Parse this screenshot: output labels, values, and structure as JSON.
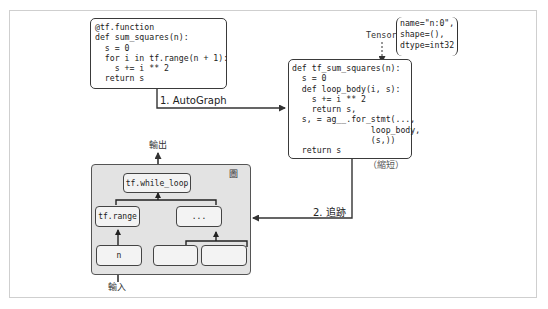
{
  "diagram": {
    "source_code": {
      "lines": [
        "@tf.function",
        "def sum_squares(n):",
        "  s = 0",
        "  for i in tf.range(n + 1):",
        "    s += i ** 2",
        "  return s"
      ]
    },
    "converted_code": {
      "lines": [
        "def tf_sum_squares(n):",
        "  s = 0",
        "  def loop_body(i, s):",
        "    s += i ** 2",
        "    return s,",
        "  s, = ag__.for_stmt(...,",
        "                loop_body,",
        "                (s,))",
        "  return s"
      ],
      "note": "（縮短）"
    },
    "tensor": {
      "label": "Tensor",
      "details": [
        "name=\"n:0\",",
        "shape=(),",
        "dtype=int32"
      ]
    },
    "steps": {
      "step1": "1. AutoGraph",
      "step2": "2. 追跡"
    },
    "graph": {
      "icon": "圖",
      "icon_name": "graph-icon",
      "output_label": "輸出",
      "input_label": "輸入",
      "nodes": {
        "while_loop": "tf.while_loop",
        "range": "tf.range",
        "ellipsis": "...",
        "n": "n",
        "blank1": "",
        "blank2": ""
      }
    },
    "colors": {
      "graph_bg": "#e3e3e3",
      "node_bg": "#f3f3f3",
      "stroke": "#333333"
    }
  }
}
